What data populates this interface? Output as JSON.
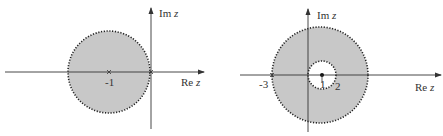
{
  "colors": {
    "region_fill": "#c8c8c8",
    "boundary": "#222222",
    "axis": "#333333",
    "background": "#ffffff"
  },
  "diagrams": [
    {
      "id": "left",
      "description": "Disk centered at -1 with radius 1 (open, dotted boundary)",
      "axes": {
        "im_label_prefix": "Im",
        "re_label_prefix": "Re",
        "variable": "z"
      },
      "center_label": "-1",
      "marks": [
        "center -1",
        "origin 0"
      ]
    },
    {
      "id": "right",
      "description": "Annulus centered at 1 with inner radius 1 and outer radius 4",
      "axes": {
        "im_label_prefix": "Im",
        "re_label_prefix": "Re",
        "variable": "z"
      },
      "tick_labels": {
        "left": "-3",
        "center": "1",
        "inner_right": "2"
      }
    }
  ]
}
